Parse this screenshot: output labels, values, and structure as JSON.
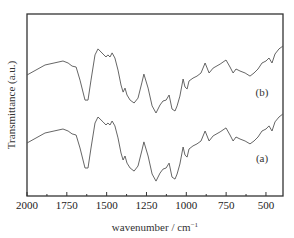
{
  "chart_data": {
    "type": "line",
    "title": "",
    "xlabel": "wavenumber / cm",
    "xlabel_superscript": "−1",
    "ylabel": "Transmittance (a.u.)",
    "xlim": [
      2000,
      393
    ],
    "ylim": [
      0,
      100
    ],
    "x_reversed": true,
    "grid": false,
    "legend": "none (inline labels)",
    "x_ticks": [
      2000,
      1750,
      1500,
      1250,
      1000,
      750,
      500
    ],
    "x_tick_labels": [
      "2000",
      "1750",
      "1500",
      "1250",
      "1000",
      "750",
      "500"
    ],
    "x_minor_ticks": [
      1875,
      1625,
      1375,
      1125,
      875,
      625
    ],
    "y_ticks_shown": false,
    "series": [
      {
        "name": "(b)",
        "label_position": "right-middle-upper",
        "x": [
          2000,
          1887,
          1774,
          1742,
          1717,
          1692,
          1667,
          1636,
          1617,
          1598,
          1573,
          1554,
          1523,
          1504,
          1492,
          1479,
          1466,
          1448,
          1429,
          1410,
          1397,
          1385,
          1372,
          1353,
          1328,
          1303,
          1278,
          1266,
          1240,
          1215,
          1190,
          1165,
          1146,
          1127,
          1108,
          1090,
          1071,
          1058,
          1040,
          1020,
          1008,
          995,
          983,
          958,
          933,
          908,
          882,
          857,
          832,
          788,
          751,
          726,
          706,
          688,
          663,
          631,
          600,
          575,
          550,
          525,
          500,
          481,
          462,
          443,
          418,
          393
        ],
        "y": [
          66.5,
          72.0,
          74.2,
          73.1,
          71.4,
          70.9,
          63.7,
          52.7,
          52.7,
          63.7,
          77.5,
          80.8,
          78.0,
          76.4,
          77.5,
          76.4,
          78.6,
          75.8,
          69.2,
          61.0,
          57.1,
          59.3,
          55.5,
          52.7,
          51.1,
          53.8,
          62.6,
          67.0,
          59.3,
          49.5,
          45.6,
          50.0,
          52.2,
          52.7,
          55.5,
          47.8,
          46.7,
          49.5,
          54.9,
          64.3,
          59.9,
          58.8,
          63.2,
          64.8,
          65.9,
          67.6,
          73.1,
          67.6,
          70.3,
          72.5,
          74.7,
          70.9,
          67.6,
          69.8,
          68.7,
          67.6,
          65.9,
          67.6,
          69.8,
          73.1,
          74.2,
          75.8,
          73.1,
          78.0,
          80.8,
          82.4
        ]
      },
      {
        "name": "(a)",
        "label_position": "right-lower",
        "x": [
          2000,
          1887,
          1774,
          1742,
          1717,
          1692,
          1667,
          1636,
          1617,
          1598,
          1573,
          1554,
          1523,
          1504,
          1492,
          1479,
          1466,
          1448,
          1429,
          1410,
          1397,
          1385,
          1372,
          1353,
          1328,
          1303,
          1278,
          1266,
          1240,
          1215,
          1190,
          1165,
          1146,
          1127,
          1108,
          1090,
          1071,
          1058,
          1040,
          1020,
          1008,
          995,
          983,
          958,
          933,
          908,
          882,
          857,
          832,
          788,
          751,
          726,
          706,
          688,
          663,
          631,
          600,
          575,
          550,
          525,
          500,
          481,
          462,
          443,
          418,
          393
        ],
        "y": [
          29.1,
          34.6,
          36.8,
          35.7,
          34.1,
          33.5,
          26.4,
          15.4,
          15.4,
          26.4,
          40.1,
          43.4,
          40.7,
          39.0,
          40.1,
          39.0,
          41.2,
          38.5,
          31.9,
          23.6,
          19.8,
          22.0,
          18.1,
          15.4,
          13.7,
          16.5,
          25.3,
          29.7,
          22.0,
          12.1,
          8.2,
          12.6,
          14.8,
          15.4,
          18.1,
          10.4,
          9.3,
          12.1,
          17.6,
          26.9,
          22.5,
          21.4,
          25.8,
          27.5,
          28.6,
          30.2,
          35.7,
          30.2,
          33.0,
          35.2,
          37.4,
          33.5,
          30.2,
          32.4,
          31.3,
          30.2,
          28.6,
          30.2,
          32.4,
          35.7,
          36.8,
          38.5,
          35.7,
          40.7,
          43.4,
          45.1
        ]
      }
    ]
  }
}
